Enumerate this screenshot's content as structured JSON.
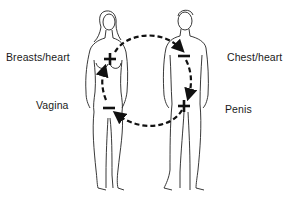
{
  "diagram": {
    "type": "energy-circulation",
    "figures": [
      {
        "id": "woman",
        "position": "left"
      },
      {
        "id": "man",
        "position": "right"
      }
    ],
    "labels": {
      "woman_upper": "Breasts/heart",
      "woman_lower": "Vagina",
      "man_upper": "Chest/heart",
      "man_lower": "Penis"
    },
    "poles": {
      "woman_upper": "+",
      "woman_lower": "−",
      "man_upper": "−",
      "man_lower": "+"
    },
    "flow": [
      {
        "from": "woman_upper",
        "to": "man_upper"
      },
      {
        "from": "man_upper",
        "to": "man_lower"
      },
      {
        "from": "man_lower",
        "to": "woman_lower"
      },
      {
        "from": "woman_lower",
        "to": "woman_upper"
      }
    ],
    "colors": {
      "line": "#111111",
      "background": "#ffffff"
    }
  }
}
